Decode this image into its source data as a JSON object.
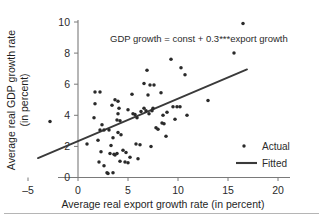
{
  "chart_data": {
    "type": "scatter",
    "title": "",
    "xlabel": "Average real export growth rate (in percent)",
    "ylabel_line1": "Average real GDP growth rate",
    "ylabel_line2": "(in percent)",
    "xlim": [
      -5,
      20
    ],
    "ylim": [
      0,
      10
    ],
    "xticks": [
      -5,
      0,
      5,
      10,
      15,
      20
    ],
    "yticks": [
      0,
      2,
      4,
      6,
      8,
      10
    ],
    "xtick_labels": [
      "–5",
      "0",
      "5",
      "10",
      "15",
      "20"
    ],
    "ytick_labels": [
      "0",
      "2",
      "4",
      "6",
      "8",
      "10"
    ],
    "grid": false,
    "annotation": "GDP growth = const + 0.3***export growth",
    "legend_position": "bottom-right",
    "series": [
      {
        "name": "Actual",
        "type": "scatter",
        "marker": "dot",
        "color": "#2a2a2a",
        "points": [
          [
            -2.8,
            3.6
          ],
          [
            0.9,
            2.15
          ],
          [
            1.7,
            5.5
          ],
          [
            2.2,
            5.5
          ],
          [
            1.7,
            4.75
          ],
          [
            1.6,
            3.85
          ],
          [
            2.4,
            3.4
          ],
          [
            2.2,
            3.05
          ],
          [
            2.6,
            3.05
          ],
          [
            3.1,
            3.05
          ],
          [
            2.0,
            2.4
          ],
          [
            2.3,
            1.65
          ],
          [
            2.1,
            1.0
          ],
          [
            2.6,
            0.75
          ],
          [
            2.9,
            0.3
          ],
          [
            3.0,
            0.25
          ],
          [
            3.5,
            0.3
          ],
          [
            3.2,
            1.55
          ],
          [
            3.6,
            1.5
          ],
          [
            3.7,
            1.45
          ],
          [
            3.9,
            1.55
          ],
          [
            3.3,
            2.05
          ],
          [
            3.5,
            2.55
          ],
          [
            3.4,
            4.65
          ],
          [
            3.7,
            5.0
          ],
          [
            4.0,
            4.9
          ],
          [
            4.1,
            4.45
          ],
          [
            4.0,
            4.1
          ],
          [
            3.9,
            3.7
          ],
          [
            4.2,
            3.65
          ],
          [
            4.0,
            2.9
          ],
          [
            4.3,
            2.75
          ],
          [
            4.5,
            1.75
          ],
          [
            4.8,
            1.6
          ],
          [
            4.2,
            1.05
          ],
          [
            4.7,
            1.0
          ],
          [
            5.0,
            0.95
          ],
          [
            5.2,
            1.3
          ],
          [
            5.0,
            4.35
          ],
          [
            5.4,
            5.35
          ],
          [
            5.5,
            4.1
          ],
          [
            5.7,
            4.05
          ],
          [
            5.9,
            3.85
          ],
          [
            5.8,
            2.15
          ],
          [
            6.2,
            2.1
          ],
          [
            6.0,
            1.2
          ],
          [
            6.3,
            4.25
          ],
          [
            6.6,
            4.45
          ],
          [
            6.8,
            4.3
          ],
          [
            6.9,
            6.9
          ],
          [
            6.6,
            6.05
          ],
          [
            7.0,
            5.3
          ],
          [
            7.3,
            2.0
          ],
          [
            7.1,
            4.1
          ],
          [
            7.4,
            4.3
          ],
          [
            7.2,
            5.95
          ],
          [
            7.6,
            5.95
          ],
          [
            7.5,
            4.45
          ],
          [
            7.8,
            3.2
          ],
          [
            8.0,
            3.1
          ],
          [
            8.3,
            5.45
          ],
          [
            8.5,
            4.0
          ],
          [
            8.4,
            3.5
          ],
          [
            8.6,
            3.45
          ],
          [
            8.9,
            4.2
          ],
          [
            8.8,
            2.65
          ],
          [
            9.3,
            7.6
          ],
          [
            9.5,
            4.55
          ],
          [
            9.9,
            4.55
          ],
          [
            10.2,
            4.55
          ],
          [
            9.7,
            3.75
          ],
          [
            10.3,
            7.05
          ],
          [
            10.7,
            6.6
          ],
          [
            10.9,
            4.0
          ],
          [
            13.0,
            4.95
          ],
          [
            15.6,
            8.0
          ],
          [
            16.5,
            9.9
          ]
        ]
      },
      {
        "name": "Fitted",
        "type": "line",
        "color": "#3a3a3a",
        "endpoints": [
          [
            -4.0,
            1.25
          ],
          [
            16.9,
            6.95
          ]
        ],
        "slope": 0.3,
        "intercept": 2.45
      }
    ]
  },
  "legend": {
    "items": [
      {
        "label": "Actual",
        "marker": "dot"
      },
      {
        "label": "Fitted",
        "marker": "line"
      }
    ]
  }
}
